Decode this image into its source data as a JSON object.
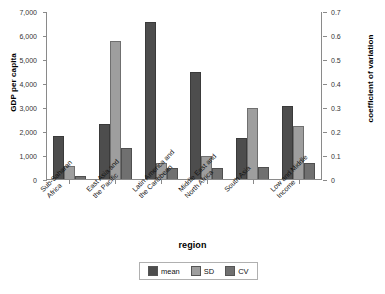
{
  "chart_data": {
    "type": "bar",
    "title": "",
    "xlabel": "region",
    "ylabel": "GDP per capita",
    "y2label": "coefficient of variation",
    "grid": false,
    "legend_position": "bottom",
    "ylim": [
      0,
      7000
    ],
    "y2lim": [
      0,
      0.7
    ],
    "yticks": [
      "0",
      "1,000",
      "2,000",
      "3,000",
      "4,000",
      "5,000",
      "6,000",
      "7,000"
    ],
    "y2ticks": [
      "0",
      "0.1",
      "0.2",
      "0.3",
      "0.4",
      "0.5",
      "0.6",
      "0.7"
    ],
    "categories": [
      "Sub-Saharan\nAfrica",
      "East Asia and\nthe Pacific",
      "Latin America and\nthe Caribbean",
      "Middle East and\nNorth Africa",
      "South Asia",
      "Low and Middle\nIncome"
    ],
    "series": [
      {
        "name": "mean",
        "axis": "left",
        "color": "#4d4d4d",
        "values": [
          1790,
          2310,
          6550,
          4450,
          1700,
          3060
        ]
      },
      {
        "name": "SD",
        "axis": "left",
        "color": "#9e9e9e",
        "values": [
          560,
          5760,
          650,
          950,
          2950,
          2200
        ]
      },
      {
        "name": "CV",
        "axis": "right",
        "color": "#707070",
        "values": [
          0.012,
          0.128,
          0.046,
          0.046,
          0.049,
          0.066
        ]
      }
    ]
  },
  "legend": {
    "items": [
      {
        "label": "mean"
      },
      {
        "label": "SD"
      },
      {
        "label": "CV"
      }
    ]
  },
  "axes": {
    "left_title": "GDP per capita",
    "right_title": "coefficient of variation",
    "x_title": "region"
  }
}
